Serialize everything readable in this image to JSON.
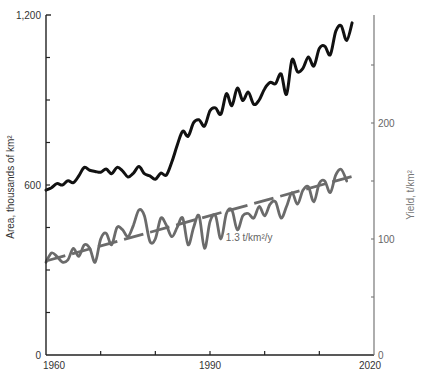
{
  "chart_data": {
    "type": "line",
    "title": "",
    "xlabel": "",
    "ylabel": "Area, thousands of km²",
    "ylabel_right": "Yield, t/km²",
    "xlim": [
      1960,
      2020
    ],
    "ylim": [
      0,
      1200
    ],
    "ylim_right": [
      0,
      293
    ],
    "x_ticks": [
      1960,
      1970,
      1980,
      1990,
      2000,
      2010,
      2020
    ],
    "x_tick_labels": [
      "1960",
      "",
      "",
      "1990",
      "",
      "",
      "2020"
    ],
    "y_ticks": [
      0,
      300,
      600,
      900,
      1200
    ],
    "y_minor_ticks": [
      150,
      450,
      750,
      1050
    ],
    "y_tick_labels": [
      "0",
      "",
      "600",
      "",
      "1,200"
    ],
    "y_right_ticks": [
      0,
      50,
      100,
      150,
      200,
      250
    ],
    "y_right_tick_labels": [
      "0",
      "",
      "100",
      "",
      "200",
      ""
    ],
    "grid": false,
    "legend": null,
    "annotations": [
      {
        "text": "1.3 t/km²/y",
        "x": 1994,
        "y_right": 98
      }
    ],
    "series": [
      {
        "name": "Area",
        "axis": "left",
        "color": "#111111",
        "style": "solid",
        "x": [
          1960,
          1961,
          1962,
          1963,
          1964,
          1965,
          1966,
          1967,
          1968,
          1969,
          1970,
          1971,
          1972,
          1973,
          1974,
          1975,
          1976,
          1977,
          1978,
          1979,
          1980,
          1981,
          1982,
          1983,
          1984,
          1985,
          1986,
          1987,
          1988,
          1989,
          1990,
          1991,
          1992,
          1993,
          1994,
          1995,
          1996,
          1997,
          1998,
          1999,
          2000,
          2001,
          2002,
          2003,
          2004,
          2005,
          2006,
          2007,
          2008,
          2009,
          2010,
          2011,
          2012,
          2013,
          2014,
          2015,
          2016
        ],
        "values": [
          582,
          590,
          605,
          600,
          615,
          608,
          632,
          662,
          652,
          648,
          645,
          656,
          640,
          662,
          650,
          628,
          642,
          665,
          640,
          632,
          620,
          642,
          635,
          680,
          740,
          790,
          772,
          820,
          830,
          808,
          862,
          872,
          850,
          922,
          880,
          942,
          898,
          928,
          885,
          900,
          940,
          962,
          958,
          992,
          920,
          1042,
          1000,
          1012,
          1052,
          1020,
          1082,
          1090,
          1060,
          1142,
          1162,
          1110,
          1172
        ]
      },
      {
        "name": "Yield",
        "axis": "right",
        "color": "#6b6b6b",
        "style": "solid",
        "x": [
          1960,
          1961,
          1962,
          1963,
          1964,
          1965,
          1966,
          1967,
          1968,
          1969,
          1970,
          1971,
          1972,
          1973,
          1974,
          1975,
          1976,
          1977,
          1978,
          1979,
          1980,
          1981,
          1982,
          1983,
          1984,
          1985,
          1986,
          1987,
          1988,
          1989,
          1990,
          1991,
          1992,
          1993,
          1994,
          1995,
          1996,
          1997,
          1998,
          1999,
          2000,
          2001,
          2002,
          2003,
          2004,
          2005,
          2006,
          2007,
          2008,
          2009,
          2010,
          2011,
          2012,
          2013,
          2014,
          2015
        ],
        "values": [
          80,
          88,
          85,
          80,
          82,
          92,
          85,
          95,
          92,
          80,
          100,
          105,
          95,
          110,
          108,
          102,
          112,
          125,
          120,
          98,
          100,
          118,
          112,
          102,
          110,
          118,
          95,
          110,
          120,
          92,
          115,
          120,
          100,
          122,
          125,
          108,
          120,
          122,
          118,
          128,
          120,
          130,
          132,
          118,
          128,
          140,
          130,
          142,
          145,
          132,
          148,
          150,
          140,
          155,
          160,
          150
        ]
      },
      {
        "name": "Yield trend (1.3 t/km²/y)",
        "axis": "right",
        "color": "#6b6b6b",
        "style": "dashed",
        "x": [
          1960,
          2016
        ],
        "values": [
          81,
          154
        ]
      }
    ]
  }
}
